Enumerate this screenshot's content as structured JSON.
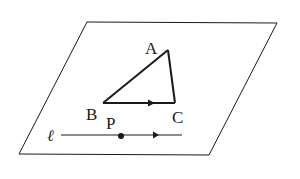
{
  "diagram": {
    "type": "geometry",
    "plane": {
      "name": "plane",
      "corners": [
        [
          87,
          22
        ],
        [
          277,
          23
        ],
        [
          209,
          155
        ],
        [
          19,
          154
        ]
      ]
    },
    "triangle": {
      "vertices": {
        "A": [
          168,
          50
        ],
        "B": [
          103,
          103
        ],
        "C": [
          175,
          103
        ]
      },
      "directed_edge": "BC"
    },
    "line": {
      "name": "ℓ",
      "from": [
        61,
        135
      ],
      "to": [
        182,
        135
      ],
      "directed": true
    },
    "point": {
      "name": "P",
      "at": [
        121,
        136
      ]
    },
    "labels": {
      "A": "A",
      "B": "B",
      "C": "C",
      "P": "P",
      "l": "ℓ"
    },
    "colors": {
      "stroke": "#1a1a1a",
      "background": "#ffffff"
    }
  }
}
